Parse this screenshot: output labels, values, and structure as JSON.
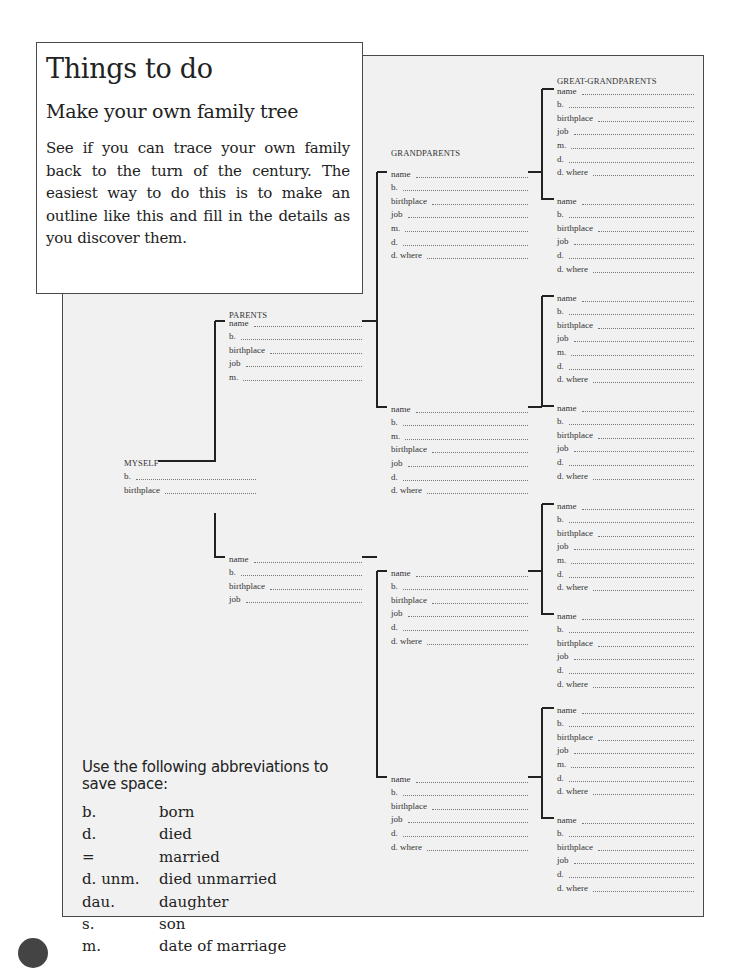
{
  "intro": {
    "title": "Things to do",
    "subtitle": "Make your own family tree",
    "body": "See if you can trace your own family back to the turn of the century. The easiest way to do this is to make an outline like this and fill in the details as you discover them."
  },
  "tree": {
    "labels": {
      "great_grandparents": "GREAT-GRANDPARENTS",
      "grandparents": "GRANDPARENTS",
      "parents": "PARENTS",
      "myself": "MYSELF"
    },
    "myself": {
      "fields": [
        "b.",
        "birthplace"
      ]
    },
    "parents": [
      {
        "fields": [
          "name",
          "b.",
          "birthplace",
          "job",
          "m."
        ]
      },
      {
        "fields": [
          "name",
          "b.",
          "birthplace",
          "job"
        ]
      }
    ],
    "grandparents": [
      {
        "fields": [
          "name",
          "b.",
          "birthplace",
          "job",
          "m.",
          "d.",
          "d. where"
        ]
      },
      {
        "fields": [
          "name",
          "b.",
          "m.",
          "birthplace",
          "job",
          "d.",
          "d. where"
        ]
      },
      {
        "fields": [
          "name",
          "b.",
          "birthplace",
          "job",
          "d.",
          "d. where"
        ]
      },
      {
        "fields": [
          "name",
          "b.",
          "birthplace",
          "job",
          "d.",
          "d. where"
        ]
      }
    ],
    "great_grandparents": [
      {
        "fields": [
          "name",
          "b.",
          "birthplace",
          "job",
          "m.",
          "d.",
          "d. where"
        ]
      },
      {
        "fields": [
          "name",
          "b.",
          "birthplace",
          "job",
          "d.",
          "d. where"
        ]
      },
      {
        "fields": [
          "name",
          "b.",
          "birthplace",
          "job",
          "m.",
          "d.",
          "d. where"
        ]
      },
      {
        "fields": [
          "name",
          "b.",
          "birthplace",
          "job",
          "d.",
          "d. where"
        ]
      },
      {
        "fields": [
          "name",
          "b.",
          "birthplace",
          "job",
          "m.",
          "d.",
          "d. where"
        ]
      },
      {
        "fields": [
          "name",
          "b.",
          "birthplace",
          "job",
          "d.",
          "d. where"
        ]
      },
      {
        "fields": [
          "name",
          "b.",
          "birthplace",
          "job",
          "m.",
          "d.",
          "d. where"
        ]
      },
      {
        "fields": [
          "name",
          "b.",
          "birthplace",
          "job",
          "d.",
          "d. where"
        ]
      }
    ]
  },
  "abbreviations": {
    "intro": "Use the following abbreviations to save space:",
    "items": [
      {
        "key": "b.",
        "meaning": "born"
      },
      {
        "key": "d.",
        "meaning": "died"
      },
      {
        "key": "=",
        "meaning": "married"
      },
      {
        "key": "d. unm.",
        "meaning": "died unmarried"
      },
      {
        "key": "dau.",
        "meaning": "daughter"
      },
      {
        "key": "s.",
        "meaning": "son"
      },
      {
        "key": "m.",
        "meaning": "date of marriage"
      }
    ]
  }
}
